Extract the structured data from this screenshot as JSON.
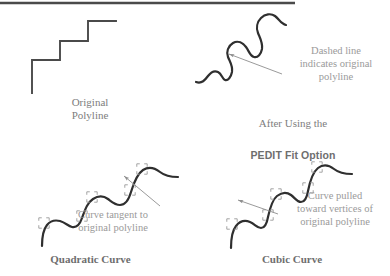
{
  "figure": {
    "background_color": "#ffffff",
    "ink_color": "#3b3b3b",
    "text_color": "#8a8a8a",
    "marker_color": "#9b9b9b",
    "top_rule": {
      "x1": 0,
      "x2": 295,
      "y": 3
    }
  },
  "panels": {
    "original": {
      "caption": "Original\nPolyline",
      "shape_name": "staircase-polyline",
      "path": "M 32 93 L 32 60 L 60 60 L 60 41 L 88 41 L 88 21 L 116 21"
    },
    "pedit": {
      "caption_line1": "After Using the",
      "caption_line2": "PEDIT Fit Option",
      "shape_name": "fitted-serpentine-curve",
      "annotation": "Dashed line\nindicates original\npolyline",
      "path": "M 196 82 C 202 84 205 80 208 76 C 211 72 214 70 218 72 C 222 74 222 79 225 80 C 228 81 231 77 232 72 C 233 66 230 62 228 57 C 226 52 228 46 233 43 C 238 40 243 43 246 47 C 249 51 250 56 254 57 C 258 58 261 54 262 49 C 263 43 260 38 258 33 C 256 28 257 22 261 18 C 265 14 271 13 275 16 C 279 19 281 24 286 25"
    },
    "quadratic": {
      "caption": "Quadratic Curve",
      "shape_name": "quadratic-fit-curve",
      "annotation": "Curve tangent to\noriginal polyline",
      "path": "M 42 246 C 42 238 43 230 47 225 C 51 220 56 220 60 221 C 66 223 68 226 72 227 C 77 228 80 224 82 218 C 85 210 87 203 93 199 C 99 195 104 196 108 199 C 112 202 115 205 120 205 C 126 205 129 199 131 192 C 134 182 137 174 143 170 C 149 166 155 168 160 172 C 165 176 170 177 178 177",
      "vertex_markers": [
        {
          "x": 44,
          "y": 223
        },
        {
          "x": 82,
          "y": 216
        },
        {
          "x": 92,
          "y": 197
        },
        {
          "x": 130,
          "y": 190
        },
        {
          "x": 142,
          "y": 169
        }
      ]
    },
    "cubic": {
      "caption": "Cubic Curve",
      "shape_name": "cubic-fit-curve",
      "annotation": "Curve pulled\ntoward vertices of\noriginal polyline",
      "path": "M 231 248 C 231 239 232 231 236 226 C 240 221 245 220 250 222 C 255 224 257 228 261 228 C 265 228 267 223 268 217 C 270 208 272 200 277 196 C 282 192 287 192 291 195 C 295 198 297 202 301 202 C 305 202 307 197 308 191 C 310 181 313 172 318 168 C 323 164 329 165 334 169 C 339 173 344 174 352 174",
      "vertex_markers": [
        {
          "x": 232,
          "y": 224
        },
        {
          "x": 268,
          "y": 215
        },
        {
          "x": 276,
          "y": 194
        },
        {
          "x": 308,
          "y": 188
        },
        {
          "x": 317,
          "y": 167
        }
      ]
    }
  },
  "arrows": [
    {
      "name": "arrow-to-fitted-curve",
      "from_x": 282,
      "from_y": 74,
      "to_x": 229,
      "to_y": 54
    },
    {
      "name": "arrow-to-quadratic-curve",
      "from_x": 160,
      "from_y": 206,
      "to_x": 124,
      "to_y": 176
    },
    {
      "name": "arrow-to-cubic-curve",
      "from_x": 278,
      "from_y": 214,
      "to_x": 238,
      "to_y": 200
    }
  ]
}
